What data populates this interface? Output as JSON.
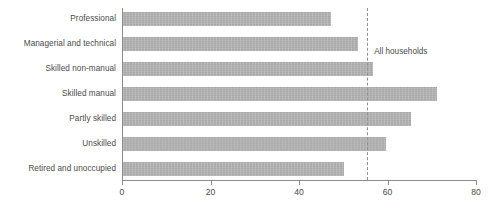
{
  "chart_data": {
    "type": "bar",
    "orientation": "horizontal",
    "title": "",
    "xlabel": "",
    "ylabel": "",
    "categories": [
      "Professional",
      "Managerial and technical",
      "Skilled non-manual",
      "Skilled manual",
      "Partly skilled",
      "Unskilled",
      "Retired and unoccupied"
    ],
    "values": [
      47,
      53,
      56.5,
      71,
      65,
      59.5,
      50
    ],
    "xlim": [
      0,
      80
    ],
    "xticks": [
      0,
      20,
      40,
      60,
      80
    ],
    "xtick_labels": [
      "0",
      "20",
      "40",
      "60",
      "80"
    ],
    "grid": false,
    "legend": false,
    "annotations": [
      {
        "name": "all-households-reference",
        "label": "All households",
        "value": 55.4,
        "style": "dashed-vertical-line"
      }
    ],
    "colors": {
      "bar_fill": "#a9a9a9",
      "axis": "#8c8c8c",
      "reference_line": "#909090",
      "text": "#4a4a4a",
      "background": "#ffffff"
    }
  }
}
